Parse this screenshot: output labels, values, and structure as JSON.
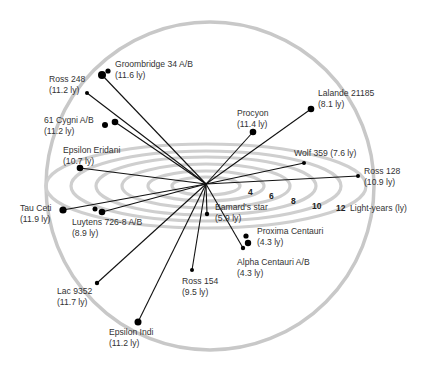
{
  "diagram": {
    "units_label": "Light-years (ly)",
    "center": {
      "x": 206,
      "y": 184
    },
    "sphere": {
      "cx": 210,
      "cy": 186,
      "r": 164,
      "color": "#c8c8c8"
    },
    "ring_color": "#cfcfcf",
    "rings": [
      {
        "label": "",
        "rx": 34,
        "ry": 9
      },
      {
        "label": "4",
        "rx": 58,
        "ry": 15
      },
      {
        "label": "6",
        "rx": 84,
        "ry": 22
      },
      {
        "label": "8",
        "rx": 110,
        "ry": 29
      },
      {
        "label": "10",
        "rx": 135,
        "ry": 35
      },
      {
        "label": "12",
        "rx": 160,
        "ry": 42
      }
    ],
    "ring_labels": [
      {
        "text": "4",
        "x": 248,
        "y": 195
      },
      {
        "text": "6",
        "x": 269,
        "y": 199
      },
      {
        "text": "8",
        "x": 291,
        "y": 204
      },
      {
        "text": "10",
        "x": 312,
        "y": 209
      },
      {
        "text": "12",
        "x": 336,
        "y": 211
      }
    ],
    "units_pos": {
      "x": 350,
      "y": 211
    },
    "stars": [
      {
        "name": "Groombridge 34 A/B",
        "distance": "(11.6 ly)",
        "line_to": {
          "x": 102,
          "y": 75
        },
        "dots": [
          {
            "x": 102,
            "y": 75,
            "r": 4
          },
          {
            "x": 108,
            "y": 71,
            "r": 2.6
          }
        ],
        "label": {
          "x": 115,
          "y": 67
        }
      },
      {
        "name": "Ross 248",
        "distance": "(11.2 ly)",
        "line_to": {
          "x": 87,
          "y": 93
        },
        "dots": [
          {
            "x": 87,
            "y": 93,
            "r": 2
          }
        ],
        "label": {
          "x": 49,
          "y": 82
        }
      },
      {
        "name": "61 Cygni A/B",
        "distance": "(11.2 ly)",
        "line_to": {
          "x": 115,
          "y": 122
        },
        "dots": [
          {
            "x": 105,
            "y": 125,
            "r": 3
          },
          {
            "x": 115,
            "y": 122,
            "r": 3.3
          }
        ],
        "label": {
          "x": 44,
          "y": 123
        }
      },
      {
        "name": "Epsilon Eridani",
        "distance": "(10.7 ly)",
        "line_to": {
          "x": 80,
          "y": 168
        },
        "dots": [
          {
            "x": 80,
            "y": 168,
            "r": 3.3
          }
        ],
        "label": {
          "x": 63,
          "y": 153
        }
      },
      {
        "name": "Tau Ceti",
        "distance": "(11.9 ly)",
        "line_to": {
          "x": 63,
          "y": 210
        },
        "dots": [
          {
            "x": 63,
            "y": 210,
            "r": 3.6
          }
        ],
        "label": {
          "x": 20,
          "y": 211
        }
      },
      {
        "name": "Luytens 726-8 A/B",
        "distance": "(8.9 ly)",
        "line_to": {
          "x": 102,
          "y": 212
        },
        "dots": [
          {
            "x": 95,
            "y": 209,
            "r": 2.5
          },
          {
            "x": 102,
            "y": 212,
            "r": 3.3
          }
        ],
        "label": {
          "x": 72,
          "y": 225
        }
      },
      {
        "name": "Lac 9352",
        "distance": "(11.7 ly)",
        "line_to": {
          "x": 97,
          "y": 283
        },
        "dots": [
          {
            "x": 97,
            "y": 283,
            "r": 2.2
          }
        ],
        "label": {
          "x": 57,
          "y": 294
        }
      },
      {
        "name": "Epsilon Indi",
        "distance": "(11.2 ly)",
        "line_to": {
          "x": 138,
          "y": 322
        },
        "dots": [
          {
            "x": 138,
            "y": 322,
            "r": 3.5
          }
        ],
        "label": {
          "x": 109,
          "y": 335
        }
      },
      {
        "name": "Ross 154",
        "distance": "(9.5 ly)",
        "line_to": {
          "x": 192,
          "y": 270
        },
        "dots": [
          {
            "x": 192,
            "y": 270,
            "r": 2
          }
        ],
        "label": {
          "x": 182,
          "y": 284
        }
      },
      {
        "name": "Bamard's star",
        "distance": "(5.9 ly)",
        "line_to": {
          "x": 207,
          "y": 214
        },
        "dots": [
          {
            "x": 207,
            "y": 214,
            "r": 2.2
          }
        ],
        "label": {
          "x": 215,
          "y": 210
        }
      },
      {
        "name": "Alpha Centauri A/B",
        "distance": "(4.3 ly)",
        "line_to": {
          "x": 243,
          "y": 248
        },
        "dots": [
          {
            "x": 243,
            "y": 248,
            "r": 2.2
          }
        ],
        "label": {
          "x": 237,
          "y": 265
        }
      },
      {
        "name": "Proxima Centauri",
        "distance": "(4.3 ly)",
        "line_to": null,
        "dots": [
          {
            "x": 246,
            "y": 236,
            "r": 2.6
          },
          {
            "x": 248,
            "y": 243,
            "r": 3.2
          }
        ],
        "label": {
          "x": 257,
          "y": 234
        }
      },
      {
        "name": "Procyon",
        "distance": "(11.4 ly)",
        "line_to": {
          "x": 253,
          "y": 132
        },
        "dots": [
          {
            "x": 253,
            "y": 132,
            "r": 3.3
          }
        ],
        "label": {
          "x": 237,
          "y": 116
        }
      },
      {
        "name": "Lalande 21185",
        "distance": "(8.1 ly)",
        "line_to": {
          "x": 311,
          "y": 109
        },
        "dots": [
          {
            "x": 311,
            "y": 109,
            "r": 3.3
          }
        ],
        "label": {
          "x": 318,
          "y": 96
        }
      },
      {
        "name": "Wolf 359",
        "distance": "(7.6 ly)",
        "line_to": {
          "x": 304,
          "y": 163
        },
        "dots": [
          {
            "x": 304,
            "y": 163,
            "r": 2
          }
        ],
        "label": {
          "x": 294,
          "y": 156
        },
        "inline": true
      },
      {
        "name": "Ross 128",
        "distance": "(10.9 ly)",
        "line_to": {
          "x": 358,
          "y": 176
        },
        "dots": [
          {
            "x": 358,
            "y": 176,
            "r": 2
          }
        ],
        "label": {
          "x": 364,
          "y": 174
        }
      }
    ]
  }
}
